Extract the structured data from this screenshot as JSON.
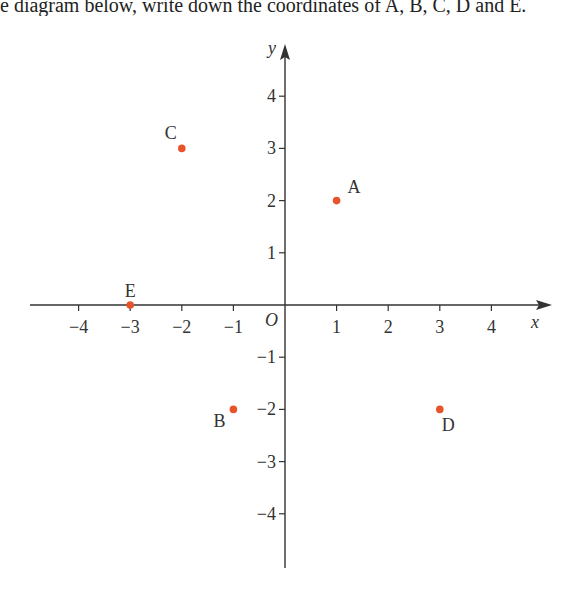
{
  "question": {
    "text": "e diagram below, write down the coordinates of A, B, C, D and E."
  },
  "chart_data": {
    "type": "scatter",
    "title": "",
    "xlabel": "x",
    "ylabel": "y",
    "origin_label": "O",
    "xlim": [
      -5,
      5
    ],
    "ylim": [
      -5,
      5
    ],
    "grid": false,
    "legend": null,
    "x_ticks": [
      -4,
      -3,
      -2,
      -1,
      1,
      2,
      3,
      4
    ],
    "x_tick_labels": [
      "−4",
      "−3",
      "−2",
      "−1",
      "1",
      "2",
      "3",
      "4"
    ],
    "y_ticks": [
      4,
      3,
      2,
      1,
      -1,
      -2,
      -3,
      -4
    ],
    "y_tick_labels": [
      "4",
      "3",
      "2",
      "1",
      "−1",
      "−2",
      "−3",
      "−4"
    ],
    "points": [
      {
        "label": "A",
        "x": 1,
        "y": 2
      },
      {
        "label": "B",
        "x": -1,
        "y": -2
      },
      {
        "label": "C",
        "x": -2,
        "y": 3
      },
      {
        "label": "D",
        "x": 3,
        "y": -2
      },
      {
        "label": "E",
        "x": -3,
        "y": 0
      }
    ],
    "point_color": "#e8542a",
    "axis_color": "#333333"
  }
}
